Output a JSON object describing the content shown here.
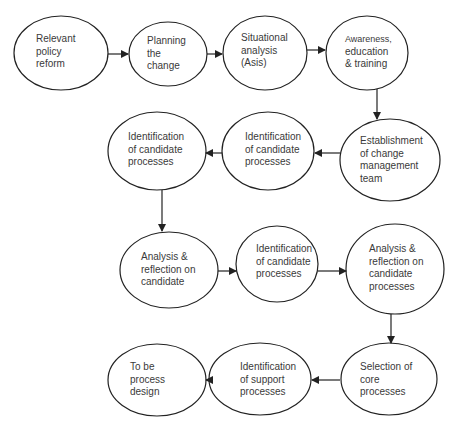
{
  "colors": {
    "stroke": "#222222",
    "text": "#3a3a3a",
    "background": "#ffffff"
  },
  "nodes": [
    {
      "id": "n1",
      "lines": [
        "Relevant",
        "policy",
        "reform"
      ]
    },
    {
      "id": "n2",
      "lines": [
        "Planning",
        "the",
        "change"
      ]
    },
    {
      "id": "n3",
      "lines": [
        "Situational",
        "analysis",
        "(Asis)"
      ]
    },
    {
      "id": "n4",
      "lines": [
        "Awareness,",
        "education",
        "& training"
      ]
    },
    {
      "id": "n5",
      "lines": [
        "Establishment",
        "of change",
        "management",
        "team"
      ]
    },
    {
      "id": "n6",
      "lines": [
        "Identification",
        "of candidate",
        "processes"
      ]
    },
    {
      "id": "n7",
      "lines": [
        "Identification",
        "of candidate",
        "processes"
      ]
    },
    {
      "id": "n8",
      "lines": [
        "Analysis &",
        "reflection on",
        "candidate"
      ]
    },
    {
      "id": "n9",
      "lines": [
        "Identification",
        "of candidate",
        "processes"
      ]
    },
    {
      "id": "n10",
      "lines": [
        "Analysis &",
        "reflection on",
        "candidate",
        "processes"
      ]
    },
    {
      "id": "n11",
      "lines": [
        "Selection of",
        "core",
        "processes"
      ]
    },
    {
      "id": "n12",
      "lines": [
        "Identification",
        "of support",
        "processes"
      ]
    },
    {
      "id": "n13",
      "lines": [
        "To be",
        "process",
        "design"
      ]
    }
  ],
  "edges": [
    {
      "from": "n1",
      "to": "n2"
    },
    {
      "from": "n2",
      "to": "n3"
    },
    {
      "from": "n3",
      "to": "n4"
    },
    {
      "from": "n4",
      "to": "n5"
    },
    {
      "from": "n5",
      "to": "n6"
    },
    {
      "from": "n6",
      "to": "n7"
    },
    {
      "from": "n7",
      "to": "n8"
    },
    {
      "from": "n8",
      "to": "n9"
    },
    {
      "from": "n9",
      "to": "n10"
    },
    {
      "from": "n10",
      "to": "n11"
    },
    {
      "from": "n11",
      "to": "n12"
    },
    {
      "from": "n12",
      "to": "n13"
    }
  ]
}
